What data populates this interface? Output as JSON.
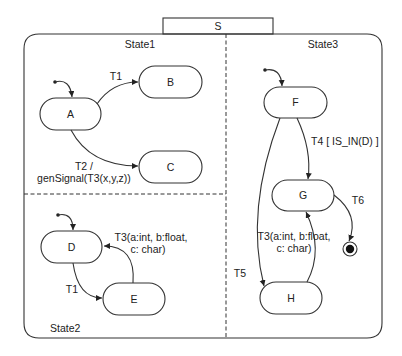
{
  "diagram": {
    "type": "statechart",
    "root_state": {
      "id": "S",
      "label": "S"
    },
    "regions": [
      {
        "id": "state1",
        "label": "State1"
      },
      {
        "id": "state2",
        "label": "State2"
      },
      {
        "id": "state3",
        "label": "State3"
      }
    ],
    "states": {
      "A": {
        "label": "A",
        "region": "State1"
      },
      "B": {
        "label": "B",
        "region": "State1"
      },
      "C": {
        "label": "C",
        "region": "State1"
      },
      "D": {
        "label": "D",
        "region": "State2"
      },
      "E": {
        "label": "E",
        "region": "State2"
      },
      "F": {
        "label": "F",
        "region": "State3"
      },
      "G": {
        "label": "G",
        "region": "State3"
      },
      "H": {
        "label": "H",
        "region": "State3"
      }
    },
    "transitions": {
      "a_b": {
        "from": "A",
        "to": "B",
        "label": "T1"
      },
      "a_c": {
        "from": "A",
        "to": "C",
        "label_line1": "T2 /",
        "label_line2": "genSignal(T3(x,y,z))"
      },
      "d_e": {
        "from": "D",
        "to": "E",
        "label": "T1"
      },
      "e_d": {
        "from": "E",
        "to": "D",
        "label_line1": "T3(a:int, b:float,",
        "label_line2": "c: char)"
      },
      "f_g": {
        "from": "F",
        "to": "G",
        "label": "T4 [ IS_IN(D) ]"
      },
      "f_h": {
        "from": "F",
        "to": "H",
        "label": "T5"
      },
      "h_g": {
        "from": "H",
        "to": "G",
        "label_line1": "T3(a:int, b:float,",
        "label_line2": "c: char)"
      },
      "g_final": {
        "from": "G",
        "to": "final",
        "label": "T6"
      }
    },
    "initial_states": [
      "A",
      "D",
      "F"
    ],
    "final_state": {
      "in_region": "State3",
      "after": "G"
    }
  }
}
